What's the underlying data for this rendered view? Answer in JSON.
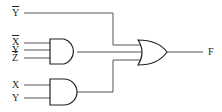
{
  "diagram": {
    "type": "logic-circuit",
    "inputs": {
      "top_not_y": "Y",
      "and1": [
        {
          "label": "X",
          "inverted": true
        },
        {
          "label": "Y",
          "inverted": false
        },
        {
          "label": "Z",
          "inverted": true
        }
      ],
      "and2": [
        {
          "label": "X",
          "inverted": false
        },
        {
          "label": "Y",
          "inverted": false
        }
      ]
    },
    "gates": [
      {
        "id": "and1",
        "type": "AND",
        "inputs": 3
      },
      {
        "id": "and2",
        "type": "AND",
        "inputs": 2
      },
      {
        "id": "or1",
        "type": "OR",
        "inputs": 3
      }
    ],
    "output": "F",
    "colors": {
      "wire": "#555555",
      "gate": "#222222",
      "background": "#ffffff"
    }
  }
}
